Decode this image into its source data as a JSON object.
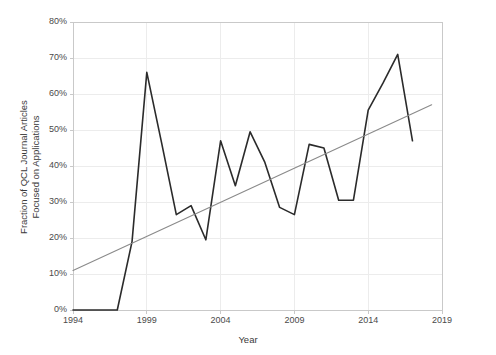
{
  "chart_data": {
    "type": "line",
    "title": "",
    "xlabel": "Year",
    "ylabel": "Fraction of QCL Journal Articles Focused on Applications",
    "ylabel_line1": "Fraction of QCL Journal Articles",
    "ylabel_line2": "Focused on Applications",
    "xlim": [
      1994,
      2019
    ],
    "ylim": [
      0,
      80
    ],
    "xticks": [
      "1994",
      "1999",
      "2004",
      "2009",
      "2014",
      "2019"
    ],
    "xtick_values": [
      1994,
      1999,
      2004,
      2009,
      2014,
      2019
    ],
    "yticks": [
      "0%",
      "10%",
      "20%",
      "30%",
      "40%",
      "50%",
      "60%",
      "70%",
      "80%"
    ],
    "ytick_values": [
      0,
      10,
      20,
      30,
      40,
      50,
      60,
      70,
      80
    ],
    "grid": true,
    "legend": "none",
    "series": [
      {
        "name": "Fraction of QCL Journal Articles Focused on Applications",
        "color": "#2b2b2b",
        "width": 1.6,
        "x": [
          1994,
          1995,
          1996,
          1997,
          1998,
          1999,
          2000,
          2001,
          2002,
          2003,
          2004,
          2005,
          2006,
          2007,
          2008,
          2009,
          2010,
          2011,
          2012,
          2013,
          2014,
          2015,
          2016,
          2017
        ],
        "values": [
          0,
          0,
          0,
          0,
          19.0,
          66.0,
          46.5,
          26.5,
          29.0,
          19.5,
          47.0,
          34.5,
          49.5,
          41.0,
          28.5,
          26.5,
          46.0,
          45.0,
          30.5,
          30.5,
          55.5,
          63.0,
          71.0,
          47.0
        ]
      },
      {
        "name": "Linear trend",
        "color": "#8a8a8a",
        "width": 1.1,
        "x": [
          1994,
          2018.3
        ],
        "values": [
          11.0,
          57.0
        ]
      }
    ]
  },
  "axes": {
    "plot_left": 73,
    "plot_right": 442,
    "plot_top": 22,
    "plot_bottom": 310,
    "frame_color": "#c9c9c9",
    "grid_color": "#ececec"
  }
}
